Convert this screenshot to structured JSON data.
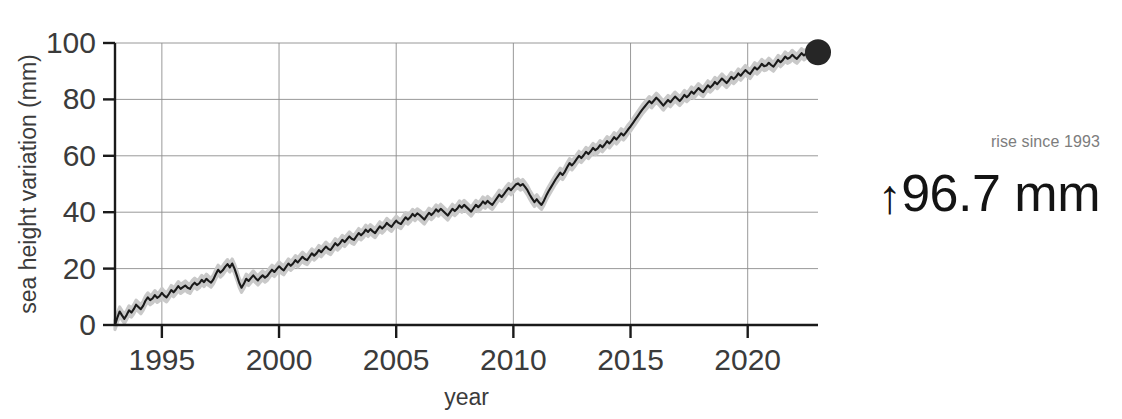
{
  "chart_data": {
    "type": "line",
    "title": "",
    "xlabel": "year",
    "ylabel": "sea height variation (mm)",
    "xlim": [
      1993,
      2023.0
    ],
    "ylim": [
      0,
      100
    ],
    "xticks": [
      1995,
      2000,
      2005,
      2010,
      2015,
      2020
    ],
    "xtick_labels": [
      "1995",
      "2000",
      "2005",
      "2010",
      "2015",
      "2020"
    ],
    "yticks": [
      0,
      20,
      40,
      60,
      80,
      100
    ],
    "ytick_labels": [
      "0",
      "20",
      "40",
      "60",
      "80",
      "100"
    ],
    "grid": true,
    "legend": "none",
    "series": [
      {
        "name": "sea height variation",
        "color": "#1a1a1a",
        "band_color": "#c9c9c9",
        "band_halfwidth": 1.6,
        "x": [
          1993.0,
          1993.1,
          1993.2,
          1993.3,
          1993.4,
          1993.5,
          1993.6,
          1993.7,
          1993.8,
          1993.9,
          1994.0,
          1994.1,
          1994.2,
          1994.3,
          1994.4,
          1994.5,
          1994.6,
          1994.7,
          1994.8,
          1994.9,
          1995.0,
          1995.1,
          1995.2,
          1995.3,
          1995.4,
          1995.5,
          1995.6,
          1995.7,
          1995.8,
          1995.9,
          1996.0,
          1996.1,
          1996.2,
          1996.3,
          1996.4,
          1996.5,
          1996.6,
          1996.7,
          1996.8,
          1996.9,
          1997.0,
          1997.1,
          1997.2,
          1997.3,
          1997.4,
          1997.5,
          1997.6,
          1997.7,
          1997.8,
          1997.9,
          1998.0,
          1998.1,
          1998.2,
          1998.3,
          1998.4,
          1998.5,
          1998.6,
          1998.7,
          1998.8,
          1998.9,
          1999.0,
          1999.1,
          1999.2,
          1999.3,
          1999.4,
          1999.5,
          1999.6,
          1999.7,
          1999.8,
          1999.9,
          2000.0,
          2000.1,
          2000.2,
          2000.3,
          2000.4,
          2000.5,
          2000.6,
          2000.7,
          2000.8,
          2000.9,
          2001.0,
          2001.1,
          2001.2,
          2001.3,
          2001.4,
          2001.5,
          2001.6,
          2001.7,
          2001.8,
          2001.9,
          2002.0,
          2002.1,
          2002.2,
          2002.3,
          2002.4,
          2002.5,
          2002.6,
          2002.7,
          2002.8,
          2002.9,
          2003.0,
          2003.1,
          2003.2,
          2003.3,
          2003.4,
          2003.5,
          2003.6,
          2003.7,
          2003.8,
          2003.9,
          2004.0,
          2004.1,
          2004.2,
          2004.3,
          2004.4,
          2004.5,
          2004.6,
          2004.7,
          2004.8,
          2004.9,
          2005.0,
          2005.1,
          2005.2,
          2005.3,
          2005.4,
          2005.5,
          2005.6,
          2005.7,
          2005.8,
          2005.9,
          2006.0,
          2006.1,
          2006.2,
          2006.3,
          2006.4,
          2006.5,
          2006.6,
          2006.7,
          2006.8,
          2006.9,
          2007.0,
          2007.1,
          2007.2,
          2007.3,
          2007.4,
          2007.5,
          2007.6,
          2007.7,
          2007.8,
          2007.9,
          2008.0,
          2008.1,
          2008.2,
          2008.3,
          2008.4,
          2008.5,
          2008.6,
          2008.7,
          2008.8,
          2008.9,
          2009.0,
          2009.1,
          2009.2,
          2009.3,
          2009.4,
          2009.5,
          2009.6,
          2009.7,
          2009.8,
          2009.9,
          2010.0,
          2010.1,
          2010.2,
          2010.3,
          2010.4,
          2010.5,
          2010.6,
          2010.7,
          2010.8,
          2010.9,
          2011.0,
          2011.1,
          2011.2,
          2011.3,
          2011.4,
          2011.5,
          2011.6,
          2011.7,
          2011.8,
          2011.9,
          2012.0,
          2012.1,
          2012.2,
          2012.3,
          2012.4,
          2012.5,
          2012.6,
          2012.7,
          2012.8,
          2012.9,
          2013.0,
          2013.1,
          2013.2,
          2013.3,
          2013.4,
          2013.5,
          2013.6,
          2013.7,
          2013.8,
          2013.9,
          2014.0,
          2014.1,
          2014.2,
          2014.3,
          2014.4,
          2014.5,
          2014.6,
          2014.7,
          2014.8,
          2014.9,
          2015.0,
          2015.1,
          2015.2,
          2015.3,
          2015.4,
          2015.5,
          2015.6,
          2015.7,
          2015.8,
          2015.9,
          2016.0,
          2016.1,
          2016.2,
          2016.3,
          2016.4,
          2016.5,
          2016.6,
          2016.7,
          2016.8,
          2016.9,
          2017.0,
          2017.1,
          2017.2,
          2017.3,
          2017.4,
          2017.5,
          2017.6,
          2017.7,
          2017.8,
          2017.9,
          2018.0,
          2018.1,
          2018.2,
          2018.3,
          2018.4,
          2018.5,
          2018.6,
          2018.7,
          2018.8,
          2018.9,
          2019.0,
          2019.1,
          2019.2,
          2019.3,
          2019.4,
          2019.5,
          2019.6,
          2019.7,
          2019.8,
          2019.9,
          2020.0,
          2020.1,
          2020.2,
          2020.3,
          2020.4,
          2020.5,
          2020.6,
          2020.7,
          2020.8,
          2020.9,
          2021.0,
          2021.1,
          2021.2,
          2021.3,
          2021.4,
          2021.5,
          2021.6,
          2021.7,
          2021.8,
          2021.9,
          2022.0,
          2022.1,
          2022.2,
          2022.3,
          2022.4,
          2022.5,
          2022.6,
          2022.7,
          2022.8,
          2022.9,
          2023.0
        ],
        "y": [
          0.0,
          2.6,
          4.8,
          3.4,
          2.2,
          3.6,
          5.2,
          4.4,
          5.6,
          7.2,
          6.4,
          5.6,
          6.8,
          8.6,
          9.8,
          8.8,
          9.4,
          10.6,
          9.6,
          10.2,
          11.4,
          10.4,
          9.8,
          11.0,
          12.4,
          11.6,
          12.6,
          13.8,
          12.8,
          13.4,
          14.0,
          13.2,
          12.8,
          14.2,
          15.0,
          14.2,
          14.8,
          16.0,
          15.2,
          16.4,
          15.6,
          15.0,
          16.2,
          18.0,
          19.6,
          18.6,
          19.4,
          20.6,
          21.6,
          20.4,
          21.8,
          20.0,
          17.6,
          15.0,
          13.2,
          14.6,
          16.4,
          15.6,
          16.6,
          17.6,
          16.6,
          15.8,
          16.8,
          17.6,
          16.8,
          17.4,
          18.6,
          19.6,
          18.8,
          19.8,
          20.8,
          20.0,
          19.4,
          20.6,
          21.8,
          21.0,
          21.8,
          23.0,
          22.2,
          23.2,
          24.2,
          23.4,
          23.0,
          24.2,
          25.4,
          24.6,
          25.4,
          26.6,
          25.8,
          26.8,
          27.8,
          27.0,
          26.6,
          27.8,
          29.0,
          28.2,
          29.0,
          30.2,
          29.4,
          30.4,
          31.4,
          30.6,
          30.2,
          31.4,
          32.6,
          31.8,
          32.6,
          33.8,
          33.0,
          34.0,
          33.2,
          32.6,
          33.8,
          35.0,
          34.2,
          35.0,
          36.2,
          35.4,
          34.8,
          36.0,
          37.0,
          36.2,
          35.8,
          37.0,
          38.2,
          37.4,
          38.2,
          39.4,
          38.6,
          39.6,
          39.0,
          38.2,
          37.4,
          38.6,
          39.8,
          39.0,
          39.8,
          41.0,
          40.2,
          41.2,
          40.4,
          39.6,
          38.8,
          40.0,
          41.2,
          40.4,
          41.2,
          42.4,
          41.6,
          42.6,
          41.8,
          41.0,
          40.2,
          41.4,
          42.6,
          41.8,
          42.6,
          43.8,
          43.0,
          44.0,
          43.2,
          42.6,
          43.8,
          45.0,
          46.2,
          45.4,
          46.4,
          47.6,
          48.6,
          47.8,
          48.8,
          49.8,
          50.2,
          49.4,
          50.0,
          49.0,
          47.8,
          46.2,
          44.8,
          43.6,
          44.6,
          43.4,
          42.6,
          44.0,
          45.8,
          47.4,
          48.8,
          50.2,
          51.6,
          52.8,
          54.0,
          53.2,
          54.4,
          56.0,
          57.4,
          56.6,
          57.6,
          58.8,
          60.0,
          59.2,
          60.2,
          61.4,
          60.6,
          61.6,
          62.8,
          62.0,
          62.6,
          63.8,
          63.0,
          64.0,
          65.2,
          64.4,
          65.4,
          66.6,
          65.8,
          66.8,
          68.0,
          67.2,
          68.2,
          69.4,
          70.4,
          71.6,
          72.8,
          74.0,
          75.2,
          76.4,
          77.4,
          78.4,
          79.4,
          78.6,
          79.6,
          80.6,
          79.8,
          78.8,
          77.8,
          78.8,
          79.8,
          79.0,
          80.0,
          81.0,
          80.2,
          79.4,
          80.4,
          81.6,
          80.8,
          81.6,
          82.8,
          82.0,
          83.0,
          84.0,
          83.2,
          82.6,
          83.8,
          85.0,
          84.2,
          85.0,
          86.2,
          85.4,
          86.4,
          87.4,
          86.6,
          85.8,
          86.8,
          88.0,
          87.2,
          88.0,
          89.2,
          88.4,
          89.4,
          90.4,
          89.6,
          89.0,
          90.2,
          91.4,
          90.6,
          91.4,
          92.6,
          91.8,
          92.0,
          93.0,
          92.2,
          91.6,
          92.8,
          94.0,
          93.2,
          94.0,
          95.2,
          94.4,
          94.8,
          95.8,
          95.0,
          94.4,
          95.4,
          96.4,
          95.6,
          96.2,
          96.8,
          96.0,
          96.4,
          96.6,
          96.7
        ]
      }
    ],
    "end_marker": {
      "x": 2023.0,
      "y": 96.7,
      "color": "#262626",
      "radius": 13
    }
  },
  "annotation": {
    "caption": "rise since 1993",
    "arrow": "↑",
    "value": "96.7 mm"
  },
  "axis_colors": {
    "axis_line": "#1a1a1a",
    "grid": "#8d8d8d",
    "tick_text": "#3b3b3b",
    "axis_title": "#3b3b3b"
  }
}
